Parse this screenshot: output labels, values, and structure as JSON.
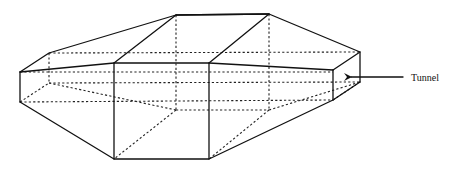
{
  "diagram": {
    "title": "",
    "shape": "hexagonal-prism-polyhedron",
    "annotations": [
      {
        "id": "tunnel",
        "text": "Tunnel",
        "arrow_from": [
          403,
          77
        ],
        "arrow_to": [
          348,
          77
        ]
      }
    ],
    "colors": {
      "line": "#111111",
      "background": "#ffffff"
    },
    "vertices": {
      "A": [
        20,
        72
      ],
      "A_b": [
        20,
        102
      ],
      "B": [
        49,
        53
      ],
      "B_b": [
        49,
        83
      ],
      "C": [
        176,
        15
      ],
      "C_b": [
        176,
        110
      ],
      "D": [
        269,
        14
      ],
      "D_b": [
        269,
        110
      ],
      "E": [
        114,
        63
      ],
      "E_b": [
        114,
        159
      ],
      "F": [
        209,
        63
      ],
      "F_b": [
        209,
        159
      ],
      "G": [
        333,
        70
      ],
      "G_b": [
        333,
        100
      ],
      "H": [
        360,
        52
      ],
      "H_b": [
        360,
        82
      ]
    }
  },
  "labels": {
    "tunnel": "Tunnel"
  }
}
